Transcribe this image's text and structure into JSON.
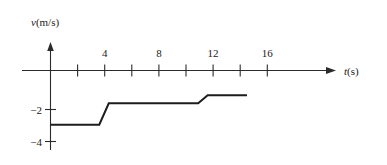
{
  "chart_data": {
    "type": "line",
    "title": "",
    "xlabel": "t(s)",
    "ylabel": "v(m/s)",
    "xlim": [
      0,
      17
    ],
    "ylim": [
      -4.6,
      0.8
    ],
    "grid": false,
    "legend": "none",
    "x_ticks": [
      2,
      4,
      6,
      8,
      10,
      12,
      14,
      16
    ],
    "x_tick_labels": [
      "",
      "4",
      "",
      "8",
      "",
      "12",
      "",
      "16"
    ],
    "y_ticks": [
      -2,
      -4
    ],
    "y_tick_labels": [
      "−2",
      "−4"
    ],
    "series": [
      {
        "name": "velocity",
        "description": "piecewise-constant step velocity, negative throughout",
        "points": [
          {
            "x": 0.0,
            "y": -3.05
          },
          {
            "x": 3.6,
            "y": -3.05
          },
          {
            "x": 4.3,
            "y": -1.85
          },
          {
            "x": 10.9,
            "y": -1.85
          },
          {
            "x": 11.6,
            "y": -1.4
          },
          {
            "x": 14.5,
            "y": -1.4
          }
        ],
        "segments": [
          {
            "from_t": 0.0,
            "to_t": 3.6,
            "value": -3.05
          },
          {
            "from_t": 4.3,
            "to_t": 10.9,
            "value": -1.85
          },
          {
            "from_t": 11.6,
            "to_t": 14.5,
            "value": -1.4
          }
        ]
      }
    ],
    "axis_labels": {
      "y_axis_var": "v",
      "y_axis_unit": "(m/s)",
      "x_axis_var": "t",
      "x_axis_unit": "(s)"
    }
  },
  "figure": {
    "y_axis_label_var": "v",
    "y_axis_label_unit": "(m/s)",
    "x_axis_label_var": "t",
    "x_axis_label_unit": "(s)",
    "tick_4": "4",
    "tick_8": "8",
    "tick_12": "12",
    "tick_16": "16",
    "tick_neg2": "−2",
    "tick_neg4": "−4"
  },
  "colors": {
    "background": "#ffffff",
    "axis": "#2b2b2b",
    "curve": "#1d1d1d",
    "text": "#1a1a1a"
  }
}
